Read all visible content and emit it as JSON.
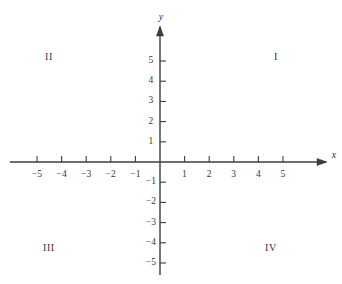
{
  "figure": {
    "type": "coordinate-plane",
    "title": "",
    "background_color": "#ffffff",
    "axis_color": "#3c3c3c",
    "text_color": "#333333"
  },
  "axes": {
    "x_axis": {
      "name": "x",
      "tick_labels": [
        "−5",
        "−4",
        "−3",
        "−2",
        "−1",
        "1",
        "2",
        "3",
        "4",
        "5"
      ],
      "tick_values": [
        -5,
        -4,
        -3,
        -2,
        -1,
        1,
        2,
        3,
        4,
        5
      ],
      "range": [
        -5.9,
        6.6
      ],
      "arrow": "right"
    },
    "y_axis": {
      "name": "y",
      "tick_labels": [
        "5",
        "4",
        "3",
        "2",
        "1",
        "−1",
        "−2",
        "−3",
        "−4",
        "−5"
      ],
      "tick_values": [
        5,
        4,
        3,
        2,
        1,
        -1,
        -2,
        -3,
        -4,
        -5
      ],
      "range": [
        -5.6,
        6.5
      ],
      "arrow": "up"
    },
    "origin_label": ""
  },
  "quadrants": [
    {
      "label": "I",
      "name": "quadrant-one",
      "x_pct": 80.7,
      "y_pct": 20.1
    },
    {
      "label": "II",
      "name": "quadrant-two",
      "x_pct": 14.3,
      "y_pct": 20.1
    },
    {
      "label": "III",
      "name": "quadrant-three",
      "x_pct": 14.3,
      "y_pct": 87.3
    },
    {
      "label": "IV",
      "name": "quadrant-four",
      "x_pct": 79.2,
      "y_pct": 87.3
    }
  ],
  "chart_data": {
    "type": "scatter",
    "title": "",
    "xlabel": "x",
    "ylabel": "y",
    "xlim": [
      -5.9,
      6.6
    ],
    "ylim": [
      -5.6,
      6.5
    ],
    "xticks": [
      -5,
      -4,
      -3,
      -2,
      -1,
      1,
      2,
      3,
      4,
      5
    ],
    "yticks": [
      -5,
      -4,
      -3,
      -2,
      -1,
      1,
      2,
      3,
      4,
      5
    ],
    "xticklabels": [
      "−5",
      "−4",
      "−3",
      "−2",
      "−1",
      "1",
      "2",
      "3",
      "4",
      "5"
    ],
    "yticklabels": [
      "−5",
      "−4",
      "−3",
      "−2",
      "−1",
      "1",
      "2",
      "3",
      "4",
      "5"
    ],
    "grid": false,
    "legend": null,
    "series": [],
    "x": [],
    "y": [],
    "annotations": [
      {
        "text": "I",
        "x": 4.7,
        "y": 4.5
      },
      {
        "text": "II",
        "x": -4.6,
        "y": 4.5
      },
      {
        "text": "III",
        "x": -4.6,
        "y": -4.3
      },
      {
        "text": "IV",
        "x": 4.5,
        "y": -4.3
      }
    ]
  },
  "geometry": {
    "origin_x": 160,
    "origin_y": 162,
    "unit_x": 24.6,
    "unit_y": 20.2,
    "x_axis_start": 10,
    "x_axis_end": 326,
    "y_axis_top": 27,
    "y_axis_bottom": 275,
    "tick_len": 6
  }
}
